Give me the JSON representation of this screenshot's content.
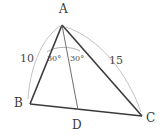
{
  "figure": {
    "type": "geometry-diagram",
    "background_color": "#ffffff",
    "stroke_color": "#3a3a3a",
    "arc_color": "#a8a8a8",
    "angle_arc_color": "#8f8f8f"
  },
  "vertices": {
    "A": {
      "label": "A",
      "x": 62,
      "y": 23
    },
    "B": {
      "label": "B",
      "x": 30,
      "y": 104
    },
    "C": {
      "label": "C",
      "x": 142,
      "y": 116
    },
    "D": {
      "label": "D",
      "x": 78,
      "y": 110
    }
  },
  "segments": [
    {
      "name": "AB",
      "from": "A",
      "to": "B"
    },
    {
      "name": "AC",
      "from": "A",
      "to": "C"
    },
    {
      "name": "BC",
      "from": "B",
      "to": "C"
    },
    {
      "name": "AD",
      "from": "A",
      "to": "D"
    }
  ],
  "side_labels": {
    "ab": "10",
    "ac": "15"
  },
  "angle_labels": {
    "bad": "30°",
    "dac": "30°"
  },
  "measure_arcs": [
    {
      "name": "arc-ab",
      "side": "AB",
      "label": "10"
    },
    {
      "name": "arc-ac",
      "side": "AC",
      "label": "15"
    }
  ]
}
